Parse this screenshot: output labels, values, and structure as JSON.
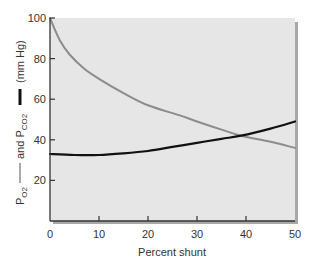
{
  "chart_data": {
    "type": "line",
    "title": "",
    "xlabel": "Percent shunt",
    "ylabel": "PO2 —— and PCO2 —— (mm Hg)",
    "ylabel_parts": {
      "po2": "P",
      "po2_sub": "O2",
      "and": "and P",
      "pco2_sub": "CO2",
      "units": "(mm Hg)"
    },
    "xlim": [
      0,
      50
    ],
    "ylim": [
      0,
      100
    ],
    "x_ticks": [
      0,
      10,
      20,
      30,
      40,
      50
    ],
    "y_ticks": [
      20,
      40,
      60,
      80,
      100
    ],
    "grid": false,
    "legend": "inline in y-axis label (gray line = PO2, black line = PCO2)",
    "series": [
      {
        "name": "PO2",
        "color": "#8c8c8c",
        "x": [
          0,
          2,
          4,
          7,
          10,
          15,
          20,
          26.5,
          30,
          35,
          39,
          45,
          50
        ],
        "values": [
          100,
          89,
          82,
          75,
          70,
          63,
          57,
          52,
          49,
          45,
          42,
          39,
          36
        ]
      },
      {
        "name": "PCO2",
        "color": "#111111",
        "x": [
          0,
          5,
          10,
          15,
          20,
          25,
          30,
          35,
          39,
          45,
          50
        ],
        "values": [
          33,
          32.5,
          32.5,
          33.3,
          34.5,
          36.5,
          38.5,
          40.5,
          42,
          45.5,
          49
        ]
      }
    ]
  },
  "colors": {
    "plot_background": "#e6e6e6",
    "axis": "#333333",
    "shadow": "#a8a8a8",
    "po2_line": "#8c8c8c",
    "pco2_line": "#111111",
    "text": "#333333"
  }
}
